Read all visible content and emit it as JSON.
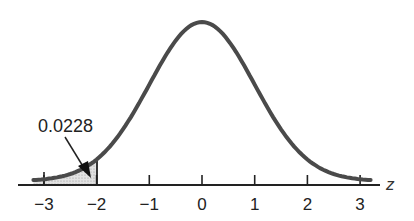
{
  "chart_data": {
    "type": "area",
    "title": "",
    "xlabel": "z",
    "ylabel": "",
    "x_ticks": [
      -3,
      -2,
      -1,
      0,
      1,
      2,
      3
    ],
    "x_tick_labels": [
      "−3",
      "−2",
      "−1",
      "0",
      "1",
      "2",
      "3"
    ],
    "xlim": [
      -3.2,
      3.2
    ],
    "grid": false,
    "legend": null,
    "series": [
      {
        "name": "standard normal density",
        "distribution": "N(0,1)",
        "x": [
          -3.2,
          -3,
          -2.5,
          -2,
          -1.5,
          -1,
          -0.5,
          0,
          0.5,
          1,
          1.5,
          2,
          2.5,
          3,
          3.2
        ],
        "y": [
          0.0024,
          0.0044,
          0.0175,
          0.054,
          0.1295,
          0.242,
          0.3521,
          0.3989,
          0.3521,
          0.242,
          0.1295,
          0.054,
          0.0175,
          0.0044,
          0.0024
        ]
      }
    ],
    "shaded_region": {
      "from": -3.2,
      "to": -2,
      "area": 0.0228
    },
    "annotations": [
      {
        "text": "0.0228",
        "points_to": "shaded area left of z = -2"
      }
    ]
  },
  "labels": {
    "annotation": "0.0228",
    "axis_var": "z",
    "ticks": [
      "−3",
      "−2",
      "−1",
      "0",
      "1",
      "2",
      "3"
    ]
  }
}
